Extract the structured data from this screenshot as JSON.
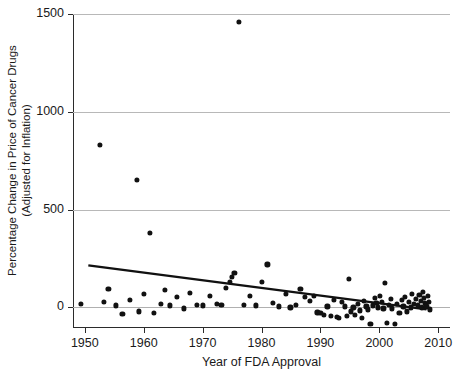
{
  "chart_data": {
    "type": "scatter",
    "title": "",
    "xlabel": "Year of FDA Approval",
    "ylabel": "Percentage Change in Price of Cancer Drugs (Adjusted for Inflation)",
    "ylabel_line1": "Percentage Change in Price of Cancer Drugs",
    "ylabel_line2": "(Adjusted for Inflation)",
    "xlim": [
      1948,
      2012
    ],
    "ylim": [
      -100,
      1500
    ],
    "xticks": [
      1950,
      1960,
      1970,
      1980,
      1990,
      2000,
      2010
    ],
    "xtick_labels": [
      "1950",
      "1960",
      "1970",
      "1980",
      "1990",
      "2000",
      "2010"
    ],
    "yticks": [
      0,
      500,
      1000,
      1500
    ],
    "ytick_labels": [
      "0",
      "500",
      "1000",
      "1500"
    ],
    "grid": "horizontal-at-yticks",
    "legend": "none",
    "marker_color": "#111111",
    "trendline_color": "#111111",
    "axis_color": "#2b2b2b",
    "gridline_color": "#b8b8b8",
    "trendline": {
      "x_start": 1950.6,
      "y_start": 215,
      "x_end": 2008.0,
      "y_end": -10
    },
    "points": [
      {
        "x": 1949.3,
        "y": 20
      },
      {
        "x": 1952.5,
        "y": 830
      },
      {
        "x": 1953.2,
        "y": 30
      },
      {
        "x": 1954.0,
        "y": 95
      },
      {
        "x": 1955.3,
        "y": 10
      },
      {
        "x": 1956.4,
        "y": -35
      },
      {
        "x": 1957.6,
        "y": 40
      },
      {
        "x": 1958.8,
        "y": 650
      },
      {
        "x": 1959.2,
        "y": -20
      },
      {
        "x": 1960.1,
        "y": 70
      },
      {
        "x": 1961.0,
        "y": 380
      },
      {
        "x": 1961.8,
        "y": -30
      },
      {
        "x": 1962.9,
        "y": 20
      },
      {
        "x": 1963.6,
        "y": 90
      },
      {
        "x": 1964.5,
        "y": 10
      },
      {
        "x": 1965.7,
        "y": 55
      },
      {
        "x": 1966.8,
        "y": -5
      },
      {
        "x": 1967.9,
        "y": 75
      },
      {
        "x": 1969.0,
        "y": 15
      },
      {
        "x": 1970.1,
        "y": 10
      },
      {
        "x": 1971.3,
        "y": 60
      },
      {
        "x": 1972.4,
        "y": 20
      },
      {
        "x": 1973.2,
        "y": 15
      },
      {
        "x": 1974.0,
        "y": 100
      },
      {
        "x": 1974.6,
        "y": 130
      },
      {
        "x": 1975.0,
        "y": 155
      },
      {
        "x": 1975.4,
        "y": 175
      },
      {
        "x": 1976.2,
        "y": 1460
      },
      {
        "x": 1977.0,
        "y": 15
      },
      {
        "x": 1978.1,
        "y": 60
      },
      {
        "x": 1979.0,
        "y": 10
      },
      {
        "x": 1980.1,
        "y": 130
      },
      {
        "x": 1981.0,
        "y": 220
      },
      {
        "x": 1982.0,
        "y": 25
      },
      {
        "x": 1983.0,
        "y": 5
      },
      {
        "x": 1984.1,
        "y": 70
      },
      {
        "x": 1984.9,
        "y": 0
      },
      {
        "x": 1985.8,
        "y": 15
      },
      {
        "x": 1986.6,
        "y": 95
      },
      {
        "x": 1987.4,
        "y": 55
      },
      {
        "x": 1988.2,
        "y": 35
      },
      {
        "x": 1988.9,
        "y": 60
      },
      {
        "x": 1989.5,
        "y": -25
      },
      {
        "x": 1990.0,
        "y": -30
      },
      {
        "x": 1990.6,
        "y": -40
      },
      {
        "x": 1991.2,
        "y": 5
      },
      {
        "x": 1991.8,
        "y": -45
      },
      {
        "x": 1992.3,
        "y": 40
      },
      {
        "x": 1992.8,
        "y": -50
      },
      {
        "x": 1993.2,
        "y": -55
      },
      {
        "x": 1993.7,
        "y": 30
      },
      {
        "x": 1994.1,
        "y": 5
      },
      {
        "x": 1994.5,
        "y": -45
      },
      {
        "x": 1994.9,
        "y": 145
      },
      {
        "x": 1995.2,
        "y": -20
      },
      {
        "x": 1995.6,
        "y": 0
      },
      {
        "x": 1995.9,
        "y": -40
      },
      {
        "x": 1996.3,
        "y": 20
      },
      {
        "x": 1996.7,
        "y": -15
      },
      {
        "x": 1997.0,
        "y": -55
      },
      {
        "x": 1997.4,
        "y": 35
      },
      {
        "x": 1997.8,
        "y": 5
      },
      {
        "x": 1998.1,
        "y": -10
      },
      {
        "x": 1998.5,
        "y": -85
      },
      {
        "x": 1998.9,
        "y": 10
      },
      {
        "x": 1999.2,
        "y": 50
      },
      {
        "x": 1999.5,
        "y": 25
      },
      {
        "x": 1999.8,
        "y": 0
      },
      {
        "x": 2000.1,
        "y": 60
      },
      {
        "x": 2000.4,
        "y": 30
      },
      {
        "x": 2000.7,
        "y": -5
      },
      {
        "x": 2001.0,
        "y": 125
      },
      {
        "x": 2001.3,
        "y": -80
      },
      {
        "x": 2001.6,
        "y": 15
      },
      {
        "x": 2001.9,
        "y": 45
      },
      {
        "x": 2002.2,
        "y": -5
      },
      {
        "x": 2002.6,
        "y": -85
      },
      {
        "x": 2003.0,
        "y": 20
      },
      {
        "x": 2003.4,
        "y": -30
      },
      {
        "x": 2003.8,
        "y": 40
      },
      {
        "x": 2004.1,
        "y": 5
      },
      {
        "x": 2004.4,
        "y": 55
      },
      {
        "x": 2004.7,
        "y": -20
      },
      {
        "x": 2005.0,
        "y": 30
      },
      {
        "x": 2005.3,
        "y": 0
      },
      {
        "x": 2005.6,
        "y": 70
      },
      {
        "x": 2005.9,
        "y": 20
      },
      {
        "x": 2006.2,
        "y": 45
      },
      {
        "x": 2006.5,
        "y": 10
      },
      {
        "x": 2006.8,
        "y": 65
      },
      {
        "x": 2007.0,
        "y": 35
      },
      {
        "x": 2007.2,
        "y": 0
      },
      {
        "x": 2007.4,
        "y": 80
      },
      {
        "x": 2007.6,
        "y": 50
      },
      {
        "x": 2007.8,
        "y": 25
      },
      {
        "x": 2008.0,
        "y": 5
      },
      {
        "x": 2008.2,
        "y": 60
      },
      {
        "x": 2008.4,
        "y": 30
      },
      {
        "x": 2008.6,
        "y": -10
      }
    ]
  }
}
